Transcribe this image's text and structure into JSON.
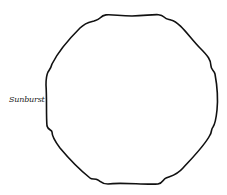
{
  "diagram": {
    "shape_name": "Sunburst",
    "label": "Sunburst",
    "stroke_color": "#111111",
    "fill_color": "#ffffff"
  }
}
